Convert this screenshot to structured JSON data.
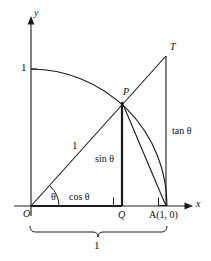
{
  "figure": {
    "kind": "unit-circle-trig-diagram",
    "background": "#ffffff",
    "stroke": "#1a1a1a",
    "width": 211,
    "height": 261
  },
  "axes": {
    "x_label": "x",
    "y_label": "y",
    "y_tick_label": "1"
  },
  "points": {
    "origin": "O",
    "p": "P",
    "q": "Q",
    "a": "A(1, 0)",
    "t": "T"
  },
  "labels": {
    "angle": "θ",
    "radius": "1",
    "cos": "cos θ",
    "sin": "sin θ",
    "tan": "tan θ",
    "brace": "1"
  }
}
